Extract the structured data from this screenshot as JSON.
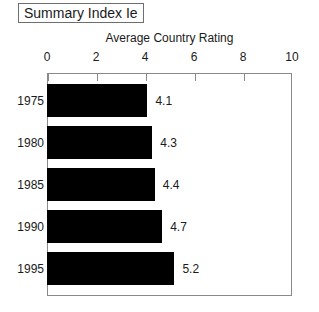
{
  "title": {
    "text": "Summary Index Ie"
  },
  "chart_data": {
    "type": "bar",
    "orientation": "horizontal",
    "title": "Summary Index Ie",
    "subtitle": "",
    "xlabel": "Average Country Rating",
    "ylabel": "",
    "categories": [
      "1975",
      "1980",
      "1985",
      "1990",
      "1995"
    ],
    "values": [
      4.1,
      4.3,
      4.4,
      4.7,
      5.2
    ],
    "value_labels": [
      "4.1",
      "4.3",
      "4.4",
      "4.7",
      "5.2"
    ],
    "xlim": [
      0,
      10
    ],
    "xticks": [
      0,
      2,
      4,
      6,
      8,
      10
    ],
    "xtick_labels": [
      "0",
      "2",
      "4",
      "6",
      "8",
      "10"
    ],
    "grid": false,
    "legend": null,
    "axis_position": "top",
    "bar_color": "#000000",
    "frame_color": "#8a8a8a",
    "text_color": "#1a1a1a",
    "series": [
      {
        "name": "Average Country Rating",
        "values": [
          4.1,
          4.3,
          4.4,
          4.7,
          5.2
        ]
      }
    ]
  }
}
